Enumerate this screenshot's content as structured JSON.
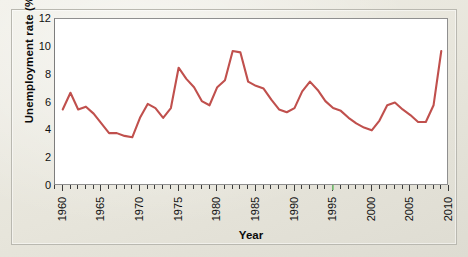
{
  "figure": {
    "x_axis_title": "Year",
    "y_axis_title": "Unemployment rate (%)",
    "line_color": "#c0504d",
    "plot_background": "#ffffff",
    "page_background": "#eceae1"
  },
  "chart_data": {
    "type": "line",
    "title": "",
    "xlabel": "Year",
    "ylabel": "Unemployment rate (%)",
    "xlim": [
      1959,
      2010
    ],
    "ylim": [
      0,
      12
    ],
    "grid": false,
    "legend": "none",
    "y_ticks": [
      0,
      2,
      4,
      6,
      8,
      10,
      12
    ],
    "y_tick_labels": [
      "0",
      "2",
      "4",
      "6",
      "8",
      "10",
      "12"
    ],
    "x_ticks": [
      1960,
      1965,
      1970,
      1975,
      1980,
      1985,
      1990,
      1995,
      2000,
      2005,
      2010
    ],
    "x_tick_labels": [
      "1960",
      "1965",
      "1970",
      "1975",
      "1980",
      "1985",
      "1990",
      "1995",
      "2000",
      "2005",
      "2010"
    ],
    "x_minor_tick_step": 1,
    "series": [
      {
        "name": "Unemployment rate",
        "color": "#c0504d",
        "x": [
          1960,
          1961,
          1962,
          1963,
          1964,
          1965,
          1966,
          1967,
          1968,
          1969,
          1970,
          1971,
          1972,
          1973,
          1974,
          1975,
          1976,
          1977,
          1978,
          1979,
          1980,
          1981,
          1982,
          1983,
          1984,
          1985,
          1986,
          1987,
          1988,
          1989,
          1990,
          1991,
          1992,
          1993,
          1994,
          1995,
          1996,
          1997,
          1998,
          1999,
          2000,
          2001,
          2002,
          2003,
          2004,
          2005,
          2006,
          2007,
          2008,
          2009
        ],
        "values": [
          5.5,
          6.7,
          5.5,
          5.7,
          5.2,
          4.5,
          3.8,
          3.8,
          3.6,
          3.5,
          4.9,
          5.9,
          5.6,
          4.9,
          5.6,
          8.5,
          7.7,
          7.1,
          6.1,
          5.8,
          7.1,
          7.6,
          9.7,
          9.6,
          7.5,
          7.2,
          7.0,
          6.2,
          5.5,
          5.3,
          5.6,
          6.8,
          7.5,
          6.9,
          6.1,
          5.6,
          5.4,
          4.9,
          4.5,
          4.2,
          4.0,
          4.7,
          5.8,
          6.0,
          5.5,
          5.1,
          4.6,
          4.6,
          5.8,
          9.7
        ]
      }
    ]
  }
}
